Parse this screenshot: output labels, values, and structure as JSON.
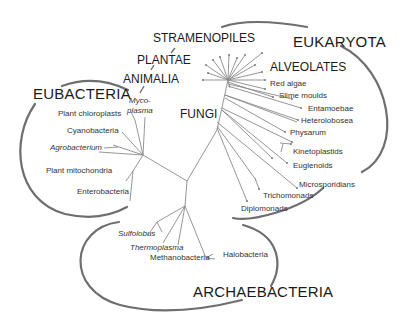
{
  "domains": {
    "eubacteria": "EUBACTERIA",
    "eukaryota": "EUKARYOTA",
    "archaebacteria": "ARCHAEBACTERIA"
  },
  "groups": {
    "stramenopiles": "STRAMENOPILES",
    "plantae": "PLANTAE",
    "animalia": "ANIMALIA",
    "alveolates": "ALVEOLATES",
    "fungi": "FUNGI"
  },
  "eubacteria_taxa": {
    "mycoplasma_1": "Myco-",
    "mycoplasma_2": "plasma",
    "plant_chloroplasts": "Plant chloroplasts",
    "cyanobacteria": "Cyanobacteria",
    "agrobacterium": "Agrobacterium",
    "plant_mitochondria": "Plant mitochondria",
    "enterobacteria": "Enterobacteria"
  },
  "eukaryota_taxa": {
    "red_algae": "Red algae",
    "slime_moulds": "Slime moulds",
    "entamoebae": "Entamoebae",
    "heterolobosea": "Heterolobosea",
    "physarum": "Physarum",
    "kinetoplastids": "Kinetoplastids",
    "euglenoids": "Euglenoids",
    "microsporidians": "Microsporidians",
    "trichomonads": "Trichomonads",
    "diplomonads": "Diplomonads"
  },
  "archaebacteria_taxa": {
    "sulfolobus": "Sulfolobus",
    "thermoplasma": "Thermoplasma",
    "methanobacteria": "Methanobacteria",
    "halobacteria": "Halobacteria"
  },
  "colors": {
    "branch": "#8a8a8a",
    "domain_arc": "#6e6e6e",
    "text": "#1a1a1a"
  }
}
